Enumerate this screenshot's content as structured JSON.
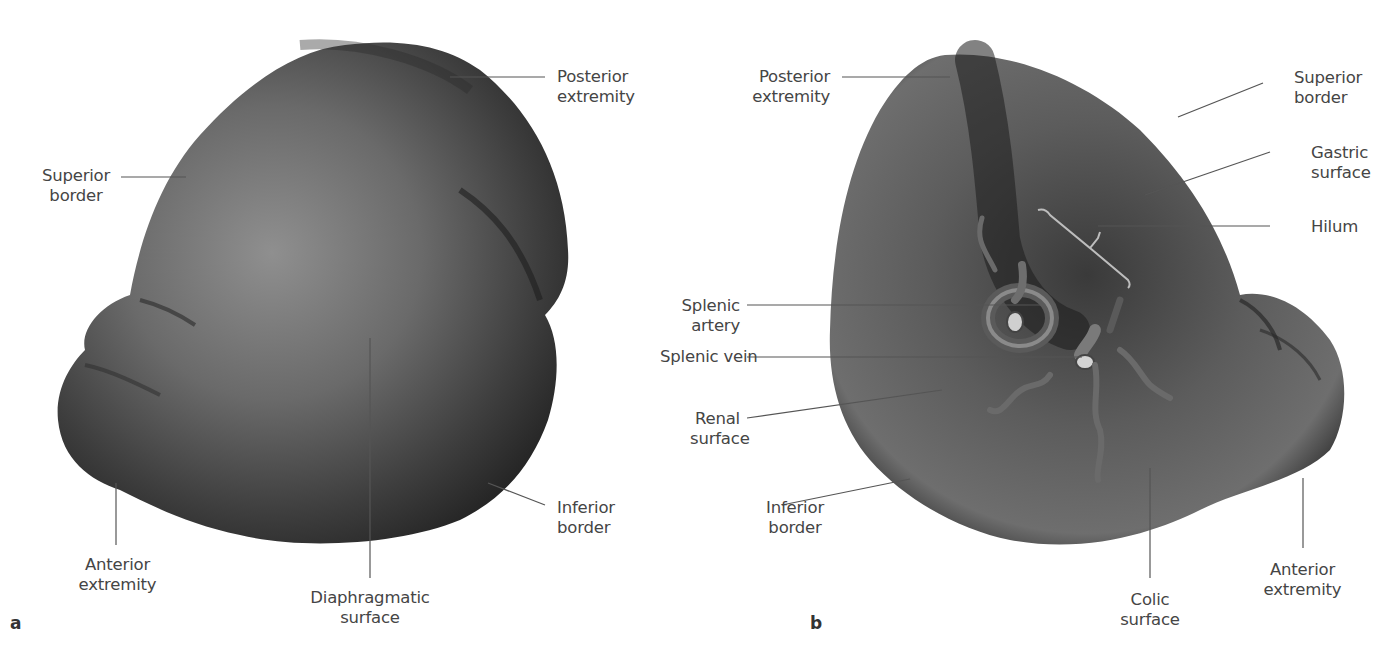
{
  "figure": {
    "colors": {
      "organ_dark": "#2e2e2e",
      "organ_mid": "#5a5a5a",
      "organ_light": "#9a9a9a",
      "leader_line": "#555555",
      "label_text": "#454545",
      "background": "#ffffff"
    }
  },
  "panels": [
    {
      "letter": "a",
      "view": "diaphragmatic view",
      "labels": {
        "posterior_extremity": [
          "Posterior",
          "extremity"
        ],
        "superior_border": [
          "Superior",
          "border"
        ],
        "anterior_extremity": [
          "Anterior",
          "extremity"
        ],
        "diaphragmatic_surface": [
          "Diaphragmatic",
          "surface"
        ],
        "inferior_border": [
          "Inferior",
          "border"
        ]
      }
    },
    {
      "letter": "b",
      "view": "visceral view",
      "labels": {
        "posterior_extremity": [
          "Posterior",
          "extremity"
        ],
        "superior_border": [
          "Superior",
          "border"
        ],
        "gastric_surface": [
          "Gastric",
          "surface"
        ],
        "hilum": [
          "Hilum"
        ],
        "splenic_artery": [
          "Splenic",
          "artery"
        ],
        "splenic_vein": [
          "Splenic vein"
        ],
        "renal_surface": [
          "Renal",
          "surface"
        ],
        "inferior_border": [
          "Inferior",
          "border"
        ],
        "colic_surface": [
          "Colic",
          "surface"
        ],
        "anterior_extremity": [
          "Anterior",
          "extremity"
        ]
      }
    }
  ]
}
